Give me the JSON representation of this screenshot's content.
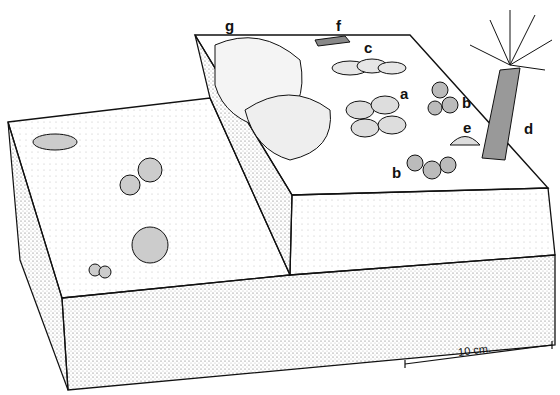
{
  "diagram": {
    "type": "paleo-block-diagram",
    "labels": [
      {
        "id": "a",
        "text": "a",
        "x": 400,
        "y": 86
      },
      {
        "id": "b1",
        "text": "b",
        "x": 462,
        "y": 95
      },
      {
        "id": "c",
        "text": "c",
        "x": 364,
        "y": 40
      },
      {
        "id": "d",
        "text": "d",
        "x": 524,
        "y": 121
      },
      {
        "id": "e",
        "text": "e",
        "x": 463,
        "y": 120
      },
      {
        "id": "b2",
        "text": "b",
        "x": 392,
        "y": 165
      },
      {
        "id": "f",
        "text": "f",
        "x": 336,
        "y": 18
      },
      {
        "id": "g",
        "text": "g",
        "x": 225,
        "y": 18
      }
    ],
    "scale_bar": {
      "text": "10 cm.",
      "length_label": "10 cm."
    }
  }
}
